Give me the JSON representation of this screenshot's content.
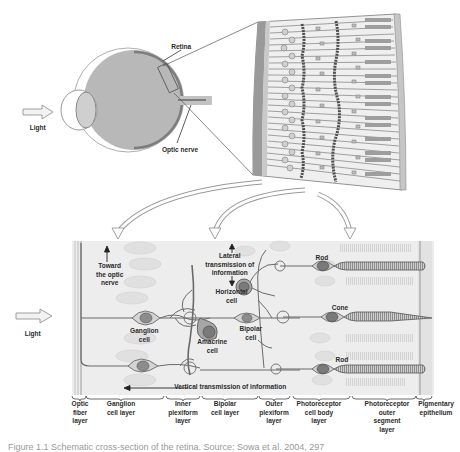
{
  "figure": {
    "eye_view": {
      "light_label": "Light",
      "retina_label": "Retina",
      "optic_nerve_label": "Optic nerve"
    },
    "detail_view": {
      "light_label": "Light",
      "annotations": {
        "toward_optic_nerve": "Toward the optic nerve",
        "toward_optic_nerve_lines": [
          "Toward",
          "the optic",
          "nerve"
        ],
        "lateral_transmission_lines": [
          "Lateral",
          "transmission of",
          "information"
        ],
        "vertical_transmission": "Vertical transmission of information"
      },
      "cells": {
        "ganglion": [
          "Ganglion",
          "cell"
        ],
        "amacrine": [
          "Amacrine",
          "cell"
        ],
        "horizontal": [
          "Horizontal",
          "cell"
        ],
        "bipolar": [
          "Bipolar",
          "cell"
        ],
        "rod_top": "Rod",
        "cone": "Cone",
        "rod_bottom": "Rod"
      },
      "layers": [
        {
          "lines": [
            "Optic",
            "fiber",
            "layer"
          ]
        },
        {
          "lines": [
            "Ganglion",
            "cell layer"
          ]
        },
        {
          "lines": [
            "Inner",
            "plexiform",
            "layer"
          ]
        },
        {
          "lines": [
            "Bipolar",
            "cell layer"
          ]
        },
        {
          "lines": [
            "Outer",
            "plexiform",
            "layer"
          ]
        },
        {
          "lines": [
            "Photoreceptor",
            "cell body",
            "layer"
          ]
        },
        {
          "lines": [
            "Photoreceptor",
            "outer",
            "segment",
            "layer"
          ]
        },
        {
          "lines": [
            "Pigmentary",
            "epithelium"
          ]
        }
      ]
    },
    "caption_partial": "Figure 1.1  Schematic cross-section of the retina. Source: Sowa et al. 2004, 297",
    "colors": {
      "eye_fill": "#b8b8b8",
      "retina_line": "#7a7a7a",
      "panel_bg": "#ededed",
      "cell_fill": "#d6d6d6",
      "nucleus_fill": "#8a8a8a",
      "dark_cell": "#9c9c9c",
      "outline": "#6a6a6a",
      "text": "#2b2b2b"
    }
  }
}
